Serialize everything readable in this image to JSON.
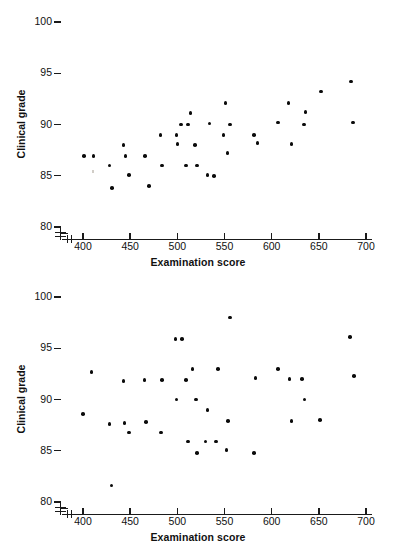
{
  "figure": {
    "background": "#ffffff",
    "point_color": "#0b0b0b",
    "axis_color": "#1a1a1a"
  },
  "panels": [
    {
      "id": "faculty",
      "title": "Faculty Raters",
      "xlabel": "Examination score",
      "ylabel": "Clinical grade"
    },
    {
      "id": "resident",
      "title": "Resident Raters",
      "xlabel": "Examination score",
      "ylabel": "Clinical grade"
    }
  ],
  "axes": {
    "x_ticks": [
      400,
      450,
      500,
      550,
      600,
      650,
      700
    ],
    "y_ticks": [
      80,
      85,
      90,
      95,
      100
    ],
    "xlim": [
      385,
      710
    ],
    "ylim": [
      80,
      100
    ],
    "x_axis_break": true,
    "y_axis_break": true
  },
  "chart_data": [
    {
      "type": "scatter",
      "title": "Faculty Raters",
      "xlabel": "Examination score",
      "ylabel": "Clinical grade",
      "xlim": [
        385,
        710
      ],
      "ylim": [
        80,
        100
      ],
      "xticks": [
        400,
        450,
        500,
        550,
        600,
        650,
        700
      ],
      "yticks": [
        80,
        85,
        90,
        95,
        100
      ],
      "grid": false,
      "legend": "none",
      "points": [
        {
          "x": 401,
          "y": 86.9
        },
        {
          "x": 411,
          "y": 86.9
        },
        {
          "x": 428,
          "y": 86.0
        },
        {
          "x": 431,
          "y": 83.8
        },
        {
          "x": 443,
          "y": 88.0
        },
        {
          "x": 445,
          "y": 86.9
        },
        {
          "x": 449,
          "y": 85.1
        },
        {
          "x": 466,
          "y": 86.9
        },
        {
          "x": 470,
          "y": 84.0
        },
        {
          "x": 482,
          "y": 89.0
        },
        {
          "x": 484,
          "y": 86.0
        },
        {
          "x": 499,
          "y": 89.0
        },
        {
          "x": 500,
          "y": 88.1
        },
        {
          "x": 504,
          "y": 90.0
        },
        {
          "x": 509,
          "y": 86.0
        },
        {
          "x": 511,
          "y": 90.0
        },
        {
          "x": 514,
          "y": 91.1
        },
        {
          "x": 519,
          "y": 88.0
        },
        {
          "x": 521,
          "y": 86.0
        },
        {
          "x": 532,
          "y": 85.1
        },
        {
          "x": 534,
          "y": 90.1
        },
        {
          "x": 539,
          "y": 85.0
        },
        {
          "x": 549,
          "y": 89.0
        },
        {
          "x": 551,
          "y": 92.1
        },
        {
          "x": 553,
          "y": 87.2
        },
        {
          "x": 556,
          "y": 90.0
        },
        {
          "x": 581,
          "y": 89.0
        },
        {
          "x": 585,
          "y": 88.2
        },
        {
          "x": 607,
          "y": 90.2
        },
        {
          "x": 618,
          "y": 92.1
        },
        {
          "x": 621,
          "y": 88.1
        },
        {
          "x": 634,
          "y": 90.0
        },
        {
          "x": 636,
          "y": 91.2
        },
        {
          "x": 652,
          "y": 93.2
        },
        {
          "x": 684,
          "y": 94.2
        },
        {
          "x": 686,
          "y": 90.2
        }
      ]
    },
    {
      "type": "scatter",
      "title": "Resident Raters",
      "xlabel": "Examination score",
      "ylabel": "Clinical grade",
      "xlim": [
        385,
        710
      ],
      "ylim": [
        80,
        100
      ],
      "xticks": [
        400,
        450,
        500,
        550,
        600,
        650,
        700
      ],
      "yticks": [
        80,
        85,
        90,
        95,
        100
      ],
      "grid": false,
      "legend": "none",
      "points": [
        {
          "x": 400,
          "y": 88.6
        },
        {
          "x": 409,
          "y": 92.7
        },
        {
          "x": 428,
          "y": 87.6
        },
        {
          "x": 430,
          "y": 81.6
        },
        {
          "x": 443,
          "y": 91.8
        },
        {
          "x": 444,
          "y": 87.7
        },
        {
          "x": 449,
          "y": 86.8
        },
        {
          "x": 465,
          "y": 91.9
        },
        {
          "x": 467,
          "y": 87.8
        },
        {
          "x": 483,
          "y": 86.8
        },
        {
          "x": 484,
          "y": 91.9
        },
        {
          "x": 498,
          "y": 95.9
        },
        {
          "x": 499,
          "y": 90.0
        },
        {
          "x": 505,
          "y": 95.9
        },
        {
          "x": 509,
          "y": 91.9
        },
        {
          "x": 511,
          "y": 85.9
        },
        {
          "x": 516,
          "y": 93.0
        },
        {
          "x": 520,
          "y": 90.0
        },
        {
          "x": 521,
          "y": 84.8
        },
        {
          "x": 530,
          "y": 85.9
        },
        {
          "x": 532,
          "y": 89.0
        },
        {
          "x": 541,
          "y": 85.9
        },
        {
          "x": 543,
          "y": 93.0
        },
        {
          "x": 552,
          "y": 85.1
        },
        {
          "x": 554,
          "y": 87.9
        },
        {
          "x": 556,
          "y": 98.0
        },
        {
          "x": 581,
          "y": 84.8
        },
        {
          "x": 583,
          "y": 92.1
        },
        {
          "x": 607,
          "y": 93.0
        },
        {
          "x": 619,
          "y": 92.0
        },
        {
          "x": 621,
          "y": 87.9
        },
        {
          "x": 632,
          "y": 92.0
        },
        {
          "x": 635,
          "y": 90.0
        },
        {
          "x": 651,
          "y": 88.0
        },
        {
          "x": 683,
          "y": 96.1
        },
        {
          "x": 687,
          "y": 92.3
        }
      ]
    }
  ]
}
